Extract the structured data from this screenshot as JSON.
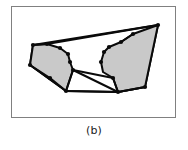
{
  "figure": {
    "caption": "(b)",
    "colors": {
      "fill_gray": "#c9c9c9",
      "stroke_black": "#0a0a0a",
      "frame_border": "#808080",
      "background": "#ffffff"
    },
    "frame": {
      "x": 11,
      "y": 6,
      "width": 165,
      "height": 112
    },
    "shapes": {
      "outer_boundary": {
        "label": "outer-polygon-boundary",
        "points": "33,45 158,25 145,87 118,92 66,91 30,65"
      },
      "left_filled_polygon": {
        "label": "left-shaded-polygon",
        "points": "33,45 47,44 60,48 68,54 70,62 73,70 66,91 50,78 30,65"
      },
      "right_filled_polygon": {
        "label": "right-shaded-polygon",
        "points": "158,25 145,87 118,92 113,78 103,72 101,62 104,52 109,47 121,42 133,34"
      },
      "inner_edges": [
        {
          "label": "edge-top-left-to-notch",
          "x1": 33,
          "y1": 45,
          "x2": 47,
          "y2": 44
        },
        {
          "label": "edge-notch-to-top-right",
          "x1": 47,
          "y1": 44,
          "x2": 158,
          "y2": 25
        },
        {
          "label": "edge-apex-to-right-notch",
          "x1": 133,
          "y1": 34,
          "x2": 121,
          "y2": 42
        },
        {
          "label": "edge-center-fan-left",
          "x1": 73,
          "y1": 70,
          "x2": 66,
          "y2": 91
        },
        {
          "label": "edge-center-fan-mid",
          "x1": 73,
          "y1": 70,
          "x2": 113,
          "y2": 78
        },
        {
          "label": "edge-center-fan-right",
          "x1": 113,
          "y1": 78,
          "x2": 118,
          "y2": 92
        },
        {
          "label": "edge-bottom-chord",
          "x1": 66,
          "y1": 91,
          "x2": 118,
          "y2": 92
        },
        {
          "label": "edge-diagonal-chord",
          "x1": 73,
          "y1": 70,
          "x2": 118,
          "y2": 92
        },
        {
          "label": "edge-left-lower",
          "x1": 30,
          "y1": 65,
          "x2": 66,
          "y2": 91
        },
        {
          "label": "edge-right-lower",
          "x1": 145,
          "y1": 87,
          "x2": 118,
          "y2": 92
        }
      ],
      "vertices": [
        {
          "label": "vertex-top-left",
          "x": 33,
          "y": 45
        },
        {
          "label": "vertex-top-notch",
          "x": 47,
          "y": 44
        },
        {
          "label": "vertex-left-upper",
          "x": 60,
          "y": 48
        },
        {
          "label": "vertex-left-mid-a",
          "x": 68,
          "y": 54
        },
        {
          "label": "vertex-left-mid-b",
          "x": 70,
          "y": 62
        },
        {
          "label": "vertex-center-left",
          "x": 73,
          "y": 70
        },
        {
          "label": "vertex-bottom-left",
          "x": 66,
          "y": 91
        },
        {
          "label": "vertex-left-side",
          "x": 50,
          "y": 78
        },
        {
          "label": "vertex-far-left",
          "x": 30,
          "y": 65
        },
        {
          "label": "vertex-top-right",
          "x": 158,
          "y": 25
        },
        {
          "label": "vertex-right-apex",
          "x": 133,
          "y": 34
        },
        {
          "label": "vertex-right-notch",
          "x": 121,
          "y": 42
        },
        {
          "label": "vertex-right-upper",
          "x": 109,
          "y": 47
        },
        {
          "label": "vertex-right-mid-a",
          "x": 104,
          "y": 52
        },
        {
          "label": "vertex-right-mid-b",
          "x": 101,
          "y": 62
        },
        {
          "label": "vertex-center-right",
          "x": 113,
          "y": 78
        },
        {
          "label": "vertex-bottom-right",
          "x": 118,
          "y": 92
        },
        {
          "label": "vertex-far-right",
          "x": 145,
          "y": 87
        }
      ]
    }
  }
}
